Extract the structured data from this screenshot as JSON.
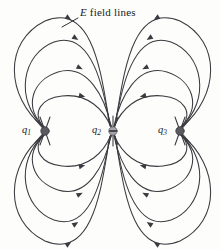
{
  "figure": {
    "kind": "electric-field-line-diagram",
    "background_color": "#fdfdfb",
    "line_color": "#3a3a40",
    "annotation": {
      "symbol": "E",
      "text": " field lines",
      "full_text": "E field lines"
    },
    "charges": [
      {
        "id": "q1",
        "label_symbol": "q",
        "label_subscript": "1",
        "sign": "positive",
        "marker": "filled-dark-dot",
        "marker_color": "#5a5a60",
        "x": 45,
        "y": 131
      },
      {
        "id": "q2",
        "label_symbol": "q",
        "label_subscript": "2",
        "sign": "negative",
        "marker": "grey-dot-with-minus",
        "marker_color": "#9a9aa0",
        "minus_glyph": "−",
        "x": 113,
        "y": 131
      },
      {
        "id": "q3",
        "label_symbol": "q",
        "label_subscript": "3",
        "sign": "positive",
        "marker": "filled-dark-dot",
        "marker_color": "#5a5a60",
        "x": 180,
        "y": 131
      }
    ],
    "field_line_flow": "arrows point from q1 and q3 inward toward q2",
    "arc_families": [
      {
        "from": "q1",
        "to": "q2",
        "quadrant": "upper-left",
        "count": 4
      },
      {
        "from": "q3",
        "to": "q2",
        "quadrant": "upper-right",
        "count": 4
      },
      {
        "from": "q1",
        "to": "q2",
        "quadrant": "lower-left",
        "count": 4
      },
      {
        "from": "q3",
        "to": "q2",
        "quadrant": "lower-right",
        "count": 4
      }
    ]
  }
}
